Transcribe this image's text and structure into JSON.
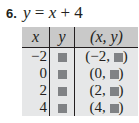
{
  "problem": {
    "number": "6.",
    "equation": {
      "lhs": "y",
      "eq": "=",
      "x": "x",
      "plus": "+",
      "const": "4"
    }
  },
  "table": {
    "headers": [
      "x",
      "y",
      "(x, y)"
    ],
    "rows": [
      {
        "x": "−2",
        "y": "",
        "pair_open": "(−2, ",
        "pair_close": ")"
      },
      {
        "x": "0",
        "y": "",
        "pair_open": "(0, ",
        "pair_close": ")"
      },
      {
        "x": "2",
        "y": "",
        "pair_open": "(2, ",
        "pair_close": ")"
      },
      {
        "x": "4",
        "y": "",
        "pair_open": "(4, ",
        "pair_close": ")"
      }
    ],
    "colors": {
      "header_bg": "#c9c9c9",
      "body_bg": "#e6e7e8",
      "blank_box": "#808285"
    }
  }
}
